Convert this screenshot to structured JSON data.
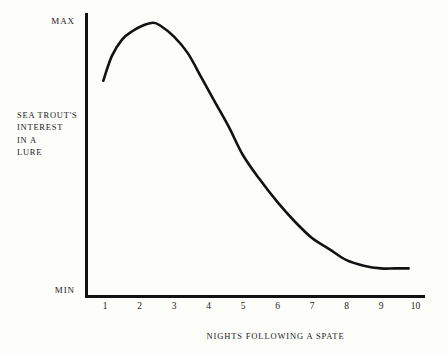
{
  "figure": {
    "background_color": "#fdfdfa",
    "ink_color": "#121212"
  },
  "axes": {
    "y_title_lines": [
      "Sea Trout's",
      "Interest",
      "In a",
      "Lure"
    ],
    "y_max_label": "Max",
    "y_min_label": "Min",
    "x_title": "Nights Following a Spate",
    "x_tick_labels": [
      "1",
      "2",
      "3",
      "4",
      "5",
      "6",
      "7",
      "8",
      "9",
      "10"
    ]
  },
  "chart_data": {
    "type": "line",
    "title": "",
    "subtitle": "",
    "xlabel": "Nights Following a Spate",
    "ylabel": "Sea Trout's Interest In a Lure",
    "xlim": [
      0,
      10.4
    ],
    "ylim": [
      0,
      1
    ],
    "x_ticks": [
      1,
      2,
      3,
      4,
      5,
      6,
      7,
      8,
      9,
      10
    ],
    "x_tick_labels": [
      "1",
      "2",
      "3",
      "4",
      "5",
      "6",
      "7",
      "8",
      "9",
      "10"
    ],
    "y_ticks": [
      0,
      1
    ],
    "y_tick_labels": [
      "Min",
      "Max"
    ],
    "grid": false,
    "legend": false,
    "legend_position": "none",
    "line_color": "#121212",
    "line_width": 2.6,
    "series": [
      {
        "name": "Sea trout's interest in a lure",
        "x": [
          0.95,
          1.2,
          1.5,
          1.8,
          2.1,
          2.4,
          2.6,
          3.0,
          3.4,
          3.8,
          4.2,
          4.6,
          5.0,
          5.5,
          6.0,
          6.5,
          7.0,
          7.5,
          8.0,
          8.5,
          9.0,
          9.4,
          9.8
        ],
        "y": [
          0.78,
          0.87,
          0.93,
          0.96,
          0.98,
          0.99,
          0.98,
          0.94,
          0.88,
          0.79,
          0.7,
          0.61,
          0.51,
          0.42,
          0.34,
          0.27,
          0.21,
          0.17,
          0.13,
          0.11,
          0.1,
          0.1,
          0.1
        ]
      }
    ],
    "annotations": [
      {
        "text": "Max",
        "position": "y-axis-top"
      },
      {
        "text": "Min",
        "position": "y-axis-bottom"
      }
    ]
  }
}
